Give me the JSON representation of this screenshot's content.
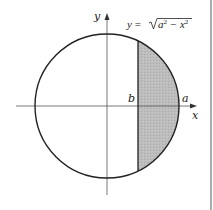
{
  "diagram": {
    "type": "circle-segment-area",
    "labels": {
      "y_axis": "y",
      "x_axis": "x",
      "b": "b",
      "a": "a",
      "equation_prefix": "y = ",
      "equation_radicand": "a",
      "equation_exp1": "2",
      "equation_minus": " − x",
      "equation_exp2": "2"
    },
    "equation_full": "y = √(a² − x²)",
    "colors": {
      "stroke": "#222222",
      "axis": "#555555",
      "shade": "#b9b9b9",
      "border": "#777777"
    },
    "geometry": {
      "center": [
        107,
        106
      ],
      "radius": 72,
      "b_x": 138,
      "chord_top_y": 41,
      "chord_bottom_y": 171
    }
  }
}
